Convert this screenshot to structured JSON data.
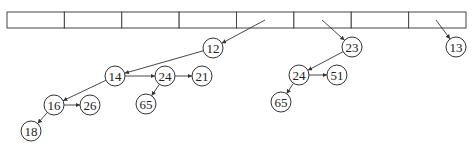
{
  "diagram": {
    "type": "binomial-queue-array",
    "array": {
      "cell_count": 8,
      "x": 7,
      "y": 12,
      "width": 459,
      "height": 16
    },
    "nodes": [
      {
        "id": "n12",
        "label": "12",
        "x": 213,
        "y": 48
      },
      {
        "id": "n14",
        "label": "14",
        "x": 115,
        "y": 76
      },
      {
        "id": "n24a",
        "label": "24",
        "x": 165,
        "y": 76
      },
      {
        "id": "n21",
        "label": "21",
        "x": 202,
        "y": 76
      },
      {
        "id": "n65a",
        "label": "65",
        "x": 146,
        "y": 104
      },
      {
        "id": "n16",
        "label": "16",
        "x": 54,
        "y": 105
      },
      {
        "id": "n26",
        "label": "26",
        "x": 90,
        "y": 105
      },
      {
        "id": "n18",
        "label": "18",
        "x": 31,
        "y": 131
      },
      {
        "id": "n23",
        "label": "23",
        "x": 352,
        "y": 47
      },
      {
        "id": "n24b",
        "label": "24",
        "x": 299,
        "y": 75
      },
      {
        "id": "n51",
        "label": "51",
        "x": 337,
        "y": 75
      },
      {
        "id": "n65b",
        "label": "65",
        "x": 281,
        "y": 102
      },
      {
        "id": "n13",
        "label": "13",
        "x": 456,
        "y": 47
      }
    ],
    "edges": [
      {
        "from_point": [
          265,
          20
        ],
        "to": "n12"
      },
      {
        "from_point": [
          322,
          20
        ],
        "to": "n23"
      },
      {
        "from_point": [
          436,
          20
        ],
        "to": "n13"
      },
      {
        "from": "n12",
        "to": "n14"
      },
      {
        "from": "n14",
        "to": "n24a"
      },
      {
        "from": "n24a",
        "to": "n21"
      },
      {
        "from": "n24a",
        "to": "n65a"
      },
      {
        "from": "n14",
        "to": "n16"
      },
      {
        "from": "n16",
        "to": "n26"
      },
      {
        "from": "n16",
        "to": "n18"
      },
      {
        "from": "n23",
        "to": "n24b"
      },
      {
        "from": "n24b",
        "to": "n51"
      },
      {
        "from": "n24b",
        "to": "n65b"
      }
    ],
    "node_radius": 10,
    "colors": {
      "stroke": "#333333",
      "fill": "#ffffff",
      "text": "#222222"
    }
  }
}
